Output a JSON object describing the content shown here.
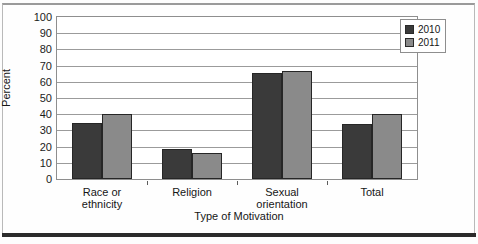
{
  "chart_data": {
    "type": "bar",
    "title": "",
    "subtitle": "",
    "xlabel": "Type of Motivation",
    "ylabel": "Percent",
    "categories": [
      "Race or ethnicity",
      "Religion",
      "Sexual orientation",
      "Total"
    ],
    "category_lines": [
      [
        "Race or",
        "ethnicity"
      ],
      [
        "Religion",
        ""
      ],
      [
        "Sexual",
        "orientation"
      ],
      [
        "Total",
        ""
      ]
    ],
    "series": [
      {
        "name": "2010",
        "color": "#3a3a3a",
        "values": [
          34.5,
          18.5,
          65.5,
          34
        ]
      },
      {
        "name": "2011",
        "color": "#8a8a8a",
        "values": [
          40,
          16,
          66.5,
          40
        ]
      }
    ],
    "ylim": [
      0,
      100
    ],
    "ytick_step": 10,
    "yticks": [
      "100",
      "90",
      "80",
      "70",
      "60",
      "50",
      "40",
      "30",
      "20",
      "10",
      "0"
    ],
    "grid": true,
    "legend_position": "top-right-inside"
  },
  "legend": {
    "items": [
      {
        "label": "2010"
      },
      {
        "label": "2011"
      }
    ]
  },
  "axes": {
    "y_title": "Percent",
    "x_title": "Type of Motivation"
  },
  "colors": {
    "series_2010": "#3a3a3a",
    "series_2011": "#8a8a8a",
    "gridline": "#9b9b9b",
    "plot_border": "#8e8e8e",
    "frame": "#b9b9b9",
    "bottom_rule": "#2b2b2b"
  }
}
